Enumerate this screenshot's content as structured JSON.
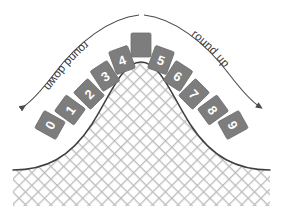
{
  "diagram": {
    "colors": {
      "box_fill": "#7d7d7d",
      "box_stroke": "#6e6e6e",
      "digit_text": "#ffffff",
      "curve_stroke": "#3f3f3f",
      "hatch_line": "#b9b9b9",
      "hatch_bg": "#ffffff",
      "label_text": "#3a3a3a",
      "arrow_stroke": "#4a4a4a",
      "background": "#ffffff"
    },
    "labels": {
      "left": "round down",
      "right": "round up"
    },
    "center_box": {
      "digit": "",
      "x": 141,
      "y": 45,
      "rotation": 0
    },
    "left_boxes": [
      {
        "digit": "0",
        "x": 50,
        "y": 125,
        "rotation": -61
      },
      {
        "digit": "1",
        "x": 70,
        "y": 110,
        "rotation": -54
      },
      {
        "digit": "2",
        "x": 89,
        "y": 94,
        "rotation": -45
      },
      {
        "digit": "3",
        "x": 105,
        "y": 76,
        "rotation": -33
      },
      {
        "digit": "4",
        "x": 122,
        "y": 60,
        "rotation": -20
      }
    ],
    "right_boxes": [
      {
        "digit": "5",
        "x": 161,
        "y": 60,
        "rotation": 20
      },
      {
        "digit": "6",
        "x": 178,
        "y": 76,
        "rotation": 33
      },
      {
        "digit": "7",
        "x": 194,
        "y": 94,
        "rotation": 45
      },
      {
        "digit": "8",
        "x": 213,
        "y": 110,
        "rotation": 54
      },
      {
        "digit": "9",
        "x": 233,
        "y": 125,
        "rotation": 61
      }
    ],
    "arrows": {
      "left_path": "M 139 15 C 110 18 78 42 54 74 C 41 91 32 101 23 107",
      "right_path": "M 144 15 C 173 18 205 42 229 74 C 242 91 251 101 260 107",
      "left_arrowhead": {
        "x": 21,
        "y": 108
      },
      "right_arrowhead": {
        "x": 262,
        "y": 108
      }
    },
    "bell_curve": {
      "path": "M 13 170 C 45 170 70 158 92 124 C 110 96 122 62 141 62 C 160 62 172 96 190 124 C 212 158 238 170 270 170",
      "fill_bottom_y": 206,
      "left_x": 13,
      "right_x": 270,
      "apex_x": 141,
      "apex_y": 62
    }
  },
  "chart_data": {
    "type": "area",
    "categories": [
      "0",
      "1",
      "2",
      "3",
      "4",
      "",
      "5",
      "6",
      "7",
      "8",
      "9"
    ],
    "values": [
      0,
      1,
      2,
      3,
      4,
      5,
      5,
      6,
      7,
      8,
      9
    ],
    "annotations": [
      "round down",
      "round up"
    ],
    "xlabel": "",
    "ylabel": "",
    "legend": []
  }
}
